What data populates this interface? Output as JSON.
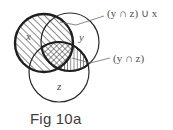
{
  "figure": {
    "caption": "Fig 10a",
    "background_color": "#ffffff",
    "ink_color": "#2b2b2b",
    "label_color": "#4f4f4f",
    "sets": [
      {
        "id": "x",
        "label": "x",
        "cx": 44,
        "cy": 43,
        "r": 29,
        "outline": "thick",
        "fill_pattern": "diagonal-hatch",
        "label_x": 26,
        "label_y": 40
      },
      {
        "id": "y",
        "label": "y",
        "cx": 70,
        "cy": 42,
        "r": 29,
        "outline": "thin",
        "fill_pattern": "none",
        "label_x": 79,
        "label_y": 41
      },
      {
        "id": "z",
        "label": "z",
        "cx": 59,
        "cy": 72,
        "r": 30,
        "outline": "thin",
        "fill_pattern": "none",
        "label_x": 57,
        "label_y": 90
      }
    ],
    "regions": [
      {
        "id": "y-intersect-z",
        "pattern": "vertical-hatch",
        "description": "(y ∩ z)"
      },
      {
        "id": "x-intersect-y-intersect-z",
        "pattern": "cross-hatch",
        "description": "center triple overlap"
      }
    ],
    "annotations": [
      {
        "id": "union-annotation",
        "text": "(y ∩ z) ∪ x",
        "text_x": 107,
        "text_y": 14,
        "leader": "M 104,16 L 76,25 L 60,22"
      },
      {
        "id": "intersection-annotation",
        "text": "(y ∩ z)",
        "text_x": 113,
        "text_y": 61,
        "leader": "M 110,58 L 90,63 L 72,58"
      }
    ]
  }
}
